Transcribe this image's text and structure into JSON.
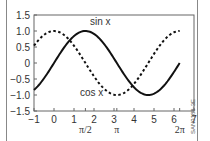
{
  "chart_data": {
    "type": "line",
    "title": "",
    "xlabel": "",
    "ylabel": "",
    "xlim": [
      -1,
      7
    ],
    "ylim": [
      -1.5,
      1.5
    ],
    "grid": false,
    "legend": "none (inline curve labels)",
    "x_ticks": [
      -1,
      0,
      1,
      2,
      3,
      4,
      5,
      6,
      7
    ],
    "x_tick_labels": [
      "−1",
      "0",
      "1",
      "2",
      "3",
      "4",
      "5",
      "6",
      "7"
    ],
    "x_special_ticks": [
      {
        "value": 1.5708,
        "label": "π/2"
      },
      {
        "value": 3.1416,
        "label": "π"
      },
      {
        "value": 6.2832,
        "label": "2π"
      }
    ],
    "y_ticks": [
      1.5,
      1.0,
      0.5,
      0,
      -0.5,
      -1.0,
      -1.5
    ],
    "y_tick_labels": [
      "1.5",
      "1.0",
      "0.5",
      "0",
      "−0.5",
      "−1.0",
      "−1.5"
    ],
    "series": [
      {
        "name": "sin x",
        "style": "solid",
        "x_range": [
          -1,
          6.2832
        ],
        "function": "sin(x)",
        "x": [
          -1,
          0,
          1,
          1.5708,
          2,
          3,
          3.1416,
          4,
          4.7124,
          5,
          6,
          6.2832
        ],
        "values": [
          -0.84,
          0,
          0.84,
          1.0,
          0.91,
          0.14,
          0,
          -0.76,
          -1.0,
          -0.96,
          -0.28,
          0
        ]
      },
      {
        "name": "cos x",
        "style": "dashed",
        "x_range": [
          -1,
          6.2832
        ],
        "function": "cos(x)",
        "x": [
          -1,
          0,
          1,
          1.5708,
          2,
          3,
          3.1416,
          4,
          4.7124,
          5,
          6,
          6.2832
        ],
        "values": [
          0.54,
          1.0,
          0.54,
          0,
          -0.42,
          -0.99,
          -1.0,
          -0.65,
          0,
          0.28,
          0.96,
          1.0
        ]
      }
    ],
    "annotations": [
      {
        "text": "sin x",
        "x": 1.6,
        "y": 1.2
      },
      {
        "text": "cos x",
        "x": 2.3,
        "y": -0.95
      }
    ]
  },
  "labels": {
    "sin": "sin x",
    "cos": "cos x",
    "side_id": "SAN0188-3E"
  }
}
